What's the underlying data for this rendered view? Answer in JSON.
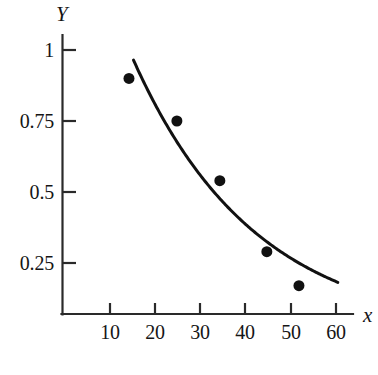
{
  "chart_data": {
    "type": "scatter",
    "title": "",
    "subtitle": "",
    "xlabel": "x",
    "ylabel": "Y",
    "xlim": [
      0,
      64
    ],
    "ylim": [
      0,
      1.1
    ],
    "grid": false,
    "legend": null,
    "x_ticks": [
      10,
      20,
      30,
      40,
      50,
      60
    ],
    "x_tick_labels": [
      "10",
      "20",
      "30",
      "40",
      "50",
      "60"
    ],
    "y_ticks": [
      0.25,
      0.5,
      0.75,
      1
    ],
    "y_tick_labels": [
      "0.25",
      "0.5",
      "0.75",
      "1"
    ],
    "series": [
      {
        "name": "observations",
        "type": "scatter",
        "marker": "filled-circle",
        "marker_size_px": 11,
        "color": "#111111",
        "x": [
          14.2,
          24.8,
          34.3,
          44.7,
          51.8
        ],
        "y": [
          0.9,
          0.75,
          0.54,
          0.29,
          0.17
        ],
        "points": [
          {
            "x": 14.2,
            "y": 0.9
          },
          {
            "x": 24.8,
            "y": 0.75
          },
          {
            "x": 34.3,
            "y": 0.54
          },
          {
            "x": 44.7,
            "y": 0.29
          },
          {
            "x": 51.8,
            "y": 0.17
          }
        ]
      },
      {
        "name": "fitted-exponential-curve",
        "type": "line",
        "color": "#111111",
        "line_width_px": 3,
        "equation": "Y = 1.69 * exp(-0.0369 * x)",
        "fit_params": {
          "a": 1.69,
          "b": 0.0369
        },
        "x_range": [
          15.2,
          60.4
        ],
        "x": [
          15.2,
          20,
          25,
          30,
          35,
          40,
          45,
          50,
          55,
          60.4
        ],
        "y": [
          0.965,
          0.808,
          0.672,
          0.559,
          0.465,
          0.386,
          0.321,
          0.267,
          0.222,
          0.183
        ]
      }
    ]
  },
  "axes": {
    "y_axis_label": "Y",
    "x_axis_label": "x",
    "y_tick_labels": [
      "1",
      "0.75",
      "0.5",
      "0.25"
    ],
    "x_tick_labels": [
      "10",
      "20",
      "30",
      "40",
      "50",
      "60"
    ]
  },
  "colors": {
    "background": "#ffffff",
    "ink": "#111111",
    "axis": "#2a2a2a"
  }
}
